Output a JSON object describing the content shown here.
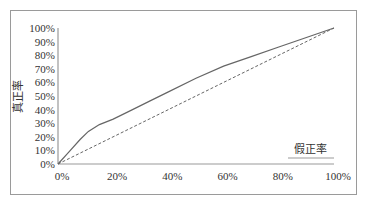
{
  "chart_data": {
    "type": "line",
    "title": "",
    "xlabel": "假正率",
    "ylabel": "真正率",
    "xlim": [
      0,
      100
    ],
    "ylim": [
      0,
      100
    ],
    "x_ticks": [
      "0%",
      "20%",
      "40%",
      "60%",
      "80%",
      "100%"
    ],
    "x_tick_values": [
      0,
      20,
      40,
      60,
      80,
      100
    ],
    "y_ticks": [
      "0%",
      "10%",
      "20%",
      "30%",
      "40%",
      "50%",
      "60%",
      "70%",
      "80%",
      "90%",
      "100%"
    ],
    "y_tick_values": [
      0,
      10,
      20,
      30,
      40,
      50,
      60,
      70,
      80,
      90,
      100
    ],
    "grid": false,
    "legend": "none",
    "series": [
      {
        "name": "ROC曲线",
        "style": "solid",
        "color": "#666666",
        "x": [
          0,
          4,
          8,
          11,
          15,
          20,
          27,
          33,
          40,
          50,
          60,
          70,
          80,
          90,
          100
        ],
        "y": [
          0,
          9,
          18,
          24,
          29,
          33,
          40,
          46,
          53,
          63,
          72,
          79,
          86,
          93,
          100
        ]
      },
      {
        "name": "随机猜测",
        "style": "dashed",
        "color": "#666666",
        "x": [
          0,
          100
        ],
        "y": [
          0,
          100
        ]
      }
    ]
  }
}
